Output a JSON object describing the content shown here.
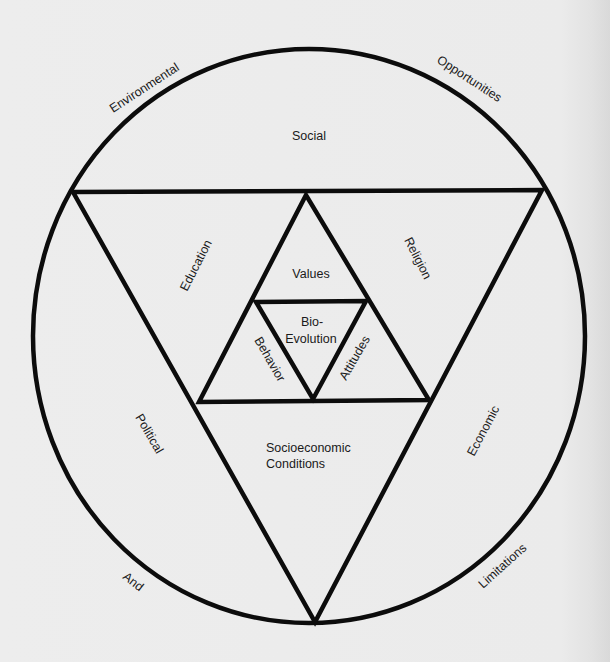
{
  "diagram": {
    "type": "nested-triangles-in-circle",
    "colors": {
      "background": "#ececec",
      "stroke": "#0c0c0c",
      "text": "#1a1a1a"
    },
    "outer_circle_labels": {
      "environmental": "Environmental",
      "opportunities": "Opportunities",
      "and": "And",
      "limitations": "Limitations"
    },
    "segments": {
      "top": "Social",
      "left": "Political",
      "right": "Economic"
    },
    "outer_triangle_sides": {
      "left": "Education",
      "right": "Religion",
      "bottom_line1": "Socioeconomic",
      "bottom_line2": "Conditions"
    },
    "middle_triangle": {
      "top": "Values",
      "left": "Behavior",
      "right": "Attitudes"
    },
    "center_triangle": {
      "line1": "Bio-",
      "line2": "Evolution"
    }
  }
}
